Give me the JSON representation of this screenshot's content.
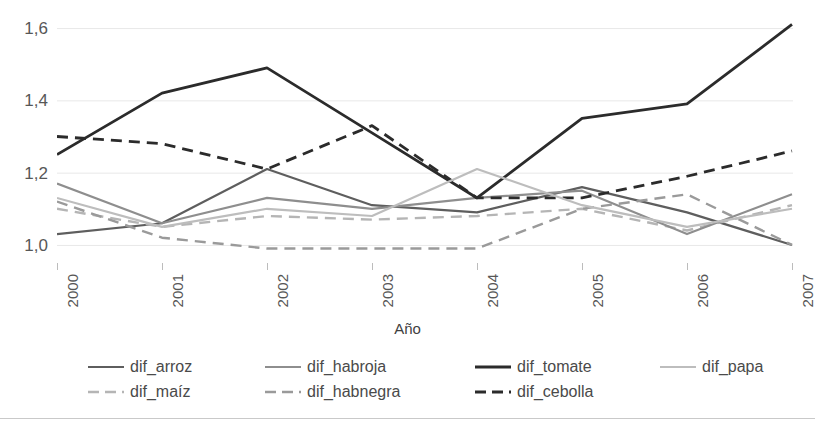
{
  "chart_data": {
    "type": "line",
    "title": "",
    "xlabel": "Año",
    "ylabel": "",
    "categories": [
      "2000",
      "2001",
      "2002",
      "2003",
      "2004",
      "2005",
      "2006",
      "2007"
    ],
    "x": [
      2000,
      2001,
      2002,
      2003,
      2004,
      2005,
      2006,
      2007
    ],
    "ylim": [
      0.95,
      1.65
    ],
    "yticks": [
      1.0,
      1.2,
      1.4,
      1.6
    ],
    "ytick_labels": [
      "1,0",
      "1,2",
      "1,4",
      "1,6"
    ],
    "grid": "horizontal",
    "legend_position": "bottom",
    "series": [
      {
        "name": "dif_arroz",
        "style": "solid",
        "color": "#5e5e5e",
        "width": 2.2,
        "values": [
          1.03,
          1.06,
          1.21,
          1.11,
          1.09,
          1.16,
          1.09,
          1.0
        ]
      },
      {
        "name": "dif_maíz",
        "style": "dashed",
        "color": "#b5b5b5",
        "width": 2.4,
        "values": [
          1.1,
          1.05,
          1.08,
          1.07,
          1.08,
          1.1,
          1.04,
          1.11
        ]
      },
      {
        "name": "dif_habroja",
        "style": "solid",
        "color": "#8e8e8e",
        "width": 2.2,
        "values": [
          1.17,
          1.06,
          1.13,
          1.1,
          1.13,
          1.15,
          1.03,
          1.14
        ]
      },
      {
        "name": "dif_habnegra",
        "style": "dashed",
        "color": "#9a9a9a",
        "width": 2.4,
        "values": [
          1.12,
          1.02,
          0.99,
          0.99,
          0.99,
          1.1,
          1.14,
          1.0
        ]
      },
      {
        "name": "dif_tomate",
        "style": "solid",
        "color": "#2b2b2b",
        "width": 2.8,
        "values": [
          1.25,
          1.42,
          1.49,
          1.31,
          1.13,
          1.35,
          1.39,
          1.61
        ]
      },
      {
        "name": "dif_cebolla",
        "style": "dashed",
        "color": "#2b2b2b",
        "width": 2.8,
        "values": [
          1.3,
          1.28,
          1.21,
          1.33,
          1.13,
          1.13,
          1.19,
          1.26
        ]
      },
      {
        "name": "dif_papa",
        "style": "solid",
        "color": "#bdbdbd",
        "width": 2.2,
        "values": [
          1.13,
          1.05,
          1.1,
          1.08,
          1.21,
          1.11,
          1.05,
          1.1
        ]
      }
    ],
    "legend_rows": [
      [
        "dif_arroz",
        "dif_habroja",
        "dif_tomate",
        "dif_papa"
      ],
      [
        "dif_maíz",
        "dif_habnegra",
        "dif_cebolla"
      ]
    ],
    "colors": {
      "grid": "#e8e8e8",
      "tick": "#bcbcbc",
      "text": "#575757",
      "rule": "#c9c9c9"
    }
  }
}
